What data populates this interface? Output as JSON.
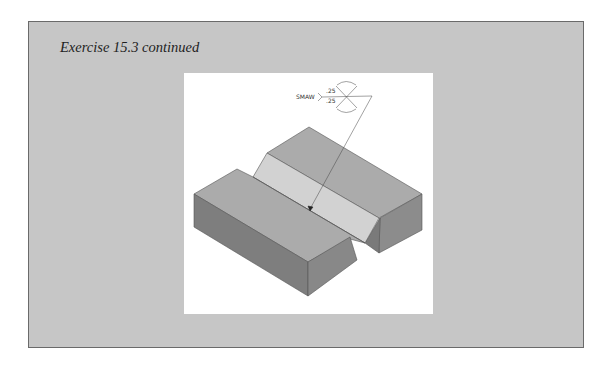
{
  "page": {
    "title": "Exercise 15.3 continued"
  },
  "figure": {
    "weld_symbol": {
      "process": "SMAW",
      "arrow_side_size": ".25",
      "other_side_size": ".25",
      "groove_type": "double-V",
      "contour": "convex"
    },
    "colors": {
      "box_background": "#c6c6c6",
      "panel_background": "#ffffff",
      "top_face": "#ababab",
      "groove_face": "#d2d2d2",
      "front_face": "#7e7e7e",
      "side_face": "#8c8c8c",
      "edge_line": "#555555"
    }
  }
}
